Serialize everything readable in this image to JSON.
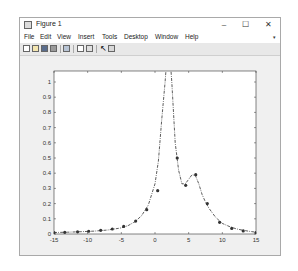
{
  "window": {
    "title": "Figure 1",
    "controls": {
      "minimize": "–",
      "maximize": "☐",
      "close": "✕"
    }
  },
  "menu": {
    "items": [
      "File",
      "Edit",
      "View",
      "Insert",
      "Tools",
      "Desktop",
      "Window",
      "Help"
    ],
    "overflow": "▾"
  },
  "toolbar": {
    "icons": [
      "new-figure-icon",
      "open-file-icon",
      "save-icon",
      "print-icon",
      "print-preview-icon",
      "colorbar-icon",
      "legend-icon",
      "pointer-icon",
      "plot-tools-icon"
    ]
  },
  "chart_data": {
    "type": "line",
    "title": "",
    "xlabel": "",
    "ylabel": "",
    "xlim": [
      -15,
      15
    ],
    "ylim": [
      0,
      1.05
    ],
    "xticks": [
      -15,
      -10,
      -5,
      0,
      5,
      10,
      15
    ],
    "xtick_labels": [
      "-15",
      "-10",
      "-5",
      "0",
      "5",
      "10",
      "15"
    ],
    "yticks": [
      0,
      0.1,
      0.2,
      0.3,
      0.4,
      0.5,
      0.6,
      0.7,
      0.8,
      0.9,
      1
    ],
    "ytick_labels": [
      "0",
      "0.1",
      "0.2",
      "0.3",
      "0.4",
      "0.5",
      "0.6",
      "0.7",
      "0.8",
      "0.9",
      "1"
    ],
    "grid": false,
    "legend": null,
    "series": [
      {
        "name": "curve",
        "style": "dash-dot line with circle markers",
        "color": "#333333",
        "curve_x": [
          -15,
          -13,
          -11,
          -9,
          -7,
          -5,
          -4,
          -3,
          -2,
          -1,
          0,
          0.5,
          1,
          1.5,
          2,
          2.5,
          3,
          3.5,
          4,
          4.5,
          5,
          5.5,
          6,
          6.5,
          7,
          7.5,
          8,
          9,
          10,
          11,
          12,
          13,
          14,
          15
        ],
        "curve_y": [
          0.01,
          0.012,
          0.015,
          0.019,
          0.026,
          0.04,
          0.055,
          0.08,
          0.12,
          0.19,
          0.33,
          0.48,
          0.75,
          1.0,
          1.3,
          1.0,
          0.6,
          0.42,
          0.33,
          0.33,
          0.36,
          0.39,
          0.385,
          0.33,
          0.26,
          0.21,
          0.17,
          0.11,
          0.07,
          0.05,
          0.035,
          0.025,
          0.018,
          0.012
        ],
        "marker_x": [
          -15,
          -13.4,
          -11.5,
          -9.85,
          -8.06,
          -6.34,
          -4.65,
          -2.87,
          -1.23,
          0.4,
          2.1,
          3.3,
          4.56,
          6.05,
          7.77,
          9.6,
          11.4,
          13.1,
          15
        ],
        "marker_y": [
          0.01,
          0.011,
          0.014,
          0.018,
          0.024,
          0.033,
          0.05,
          0.085,
          0.16,
          0.285,
          1.3,
          0.5,
          0.32,
          0.39,
          0.2,
          0.077,
          0.037,
          0.02,
          0.01
        ]
      }
    ]
  }
}
